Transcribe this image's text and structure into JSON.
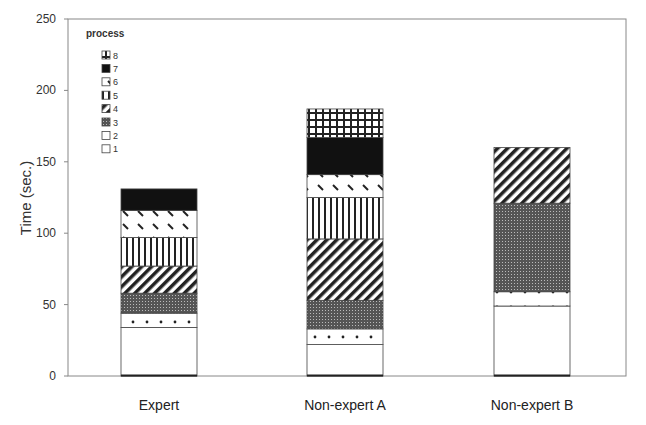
{
  "chart_data": {
    "type": "bar",
    "stacked": true,
    "title": "",
    "xlabel": "",
    "ylabel": "Time (sec.)",
    "ylim": [
      0,
      250
    ],
    "yticks": [
      0,
      50,
      100,
      150,
      200,
      250
    ],
    "grid": false,
    "legend_title": "process",
    "legend_position": "upper-left-inside",
    "categories": [
      "Expert",
      "Non-expert A",
      "Non-expert B"
    ],
    "series": [
      {
        "name": "1",
        "pattern": "blank",
        "values": [
          34,
          22,
          49
        ]
      },
      {
        "name": "2",
        "pattern": "dots",
        "values": [
          10,
          11,
          10
        ]
      },
      {
        "name": "3",
        "pattern": "dense-grid-dark",
        "values": [
          14,
          20,
          62
        ]
      },
      {
        "name": "4",
        "pattern": "diagonal-stripes",
        "values": [
          19,
          43,
          39
        ]
      },
      {
        "name": "5",
        "pattern": "vertical-lines",
        "values": [
          20,
          29,
          0
        ]
      },
      {
        "name": "6",
        "pattern": "sparse-dashes",
        "values": [
          19,
          16,
          0
        ]
      },
      {
        "name": "7",
        "pattern": "solid-black",
        "values": [
          15,
          26,
          0
        ]
      },
      {
        "name": "8",
        "pattern": "square-grid",
        "values": [
          0,
          20,
          0
        ]
      }
    ],
    "totals": [
      131,
      187,
      160
    ]
  },
  "ui": {
    "y_title": "Time (sec.)",
    "legend_title": "process"
  }
}
